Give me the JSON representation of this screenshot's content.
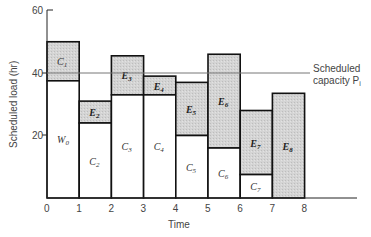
{
  "chart_data": {
    "type": "bar",
    "subtype": "stacked",
    "title": "",
    "xlabel": "Time",
    "ylabel": "Scheduled load (hr)",
    "xlim": [
      0,
      8
    ],
    "ylim": [
      0,
      60
    ],
    "x_ticks": [
      "0",
      "1",
      "2",
      "3",
      "4",
      "5",
      "6",
      "7",
      "8"
    ],
    "y_ticks": [
      "20",
      "40",
      "60"
    ],
    "grid": false,
    "capacity_line": {
      "value": 40,
      "label_line1": "Scheduled",
      "label_line2": "capacity P",
      "label_subscript": "i"
    },
    "bars": [
      {
        "x0": 0,
        "x1": 1,
        "lower_label": "W",
        "lower_sub": "0",
        "lower_value": 37.5,
        "upper_label": "C",
        "upper_sub": "1",
        "total": 50
      },
      {
        "x0": 1,
        "x1": 2,
        "lower_label": "C",
        "lower_sub": "2",
        "lower_value": 24,
        "upper_label": "E",
        "upper_sub": "2",
        "total": 31
      },
      {
        "x0": 2,
        "x1": 3,
        "lower_label": "C",
        "lower_sub": "3",
        "lower_value": 33,
        "upper_label": "E",
        "upper_sub": "3",
        "total": 45.5
      },
      {
        "x0": 3,
        "x1": 4,
        "lower_label": "C",
        "lower_sub": "4",
        "lower_value": 33,
        "upper_label": "E",
        "upper_sub": "4",
        "total": 39
      },
      {
        "x0": 4,
        "x1": 5,
        "lower_label": "C",
        "lower_sub": "5",
        "lower_value": 20,
        "upper_label": "E",
        "upper_sub": "5",
        "total": 37
      },
      {
        "x0": 5,
        "x1": 6,
        "lower_label": "C",
        "lower_sub": "6",
        "lower_value": 16,
        "upper_label": "E",
        "upper_sub": "6",
        "total": 46
      },
      {
        "x0": 6,
        "x1": 7,
        "lower_label": "C",
        "lower_sub": "7",
        "lower_value": 7.5,
        "upper_label": "E",
        "upper_sub": "7",
        "total": 28
      },
      {
        "x0": 7,
        "x1": 8,
        "lower_label": "",
        "lower_sub": "",
        "lower_value": 0,
        "upper_label": "E",
        "upper_sub": "8",
        "total": 33.5
      }
    ],
    "series": [
      {
        "name": "Lower (white) segment",
        "values": [
          37.5,
          24,
          33,
          33,
          20,
          16,
          7.5,
          0
        ]
      },
      {
        "name": "Upper (shaded) segment",
        "values": [
          12.5,
          7,
          12.5,
          6,
          17,
          30,
          20.5,
          33.5
        ]
      }
    ],
    "categories": [
      "0-1",
      "1-2",
      "2-3",
      "3-4",
      "4-5",
      "5-6",
      "6-7",
      "7-8"
    ],
    "colors": {
      "shaded": "#d2d2d2",
      "white": "#ffffff",
      "outline": "#111111",
      "capacity_line": "#777777"
    }
  }
}
